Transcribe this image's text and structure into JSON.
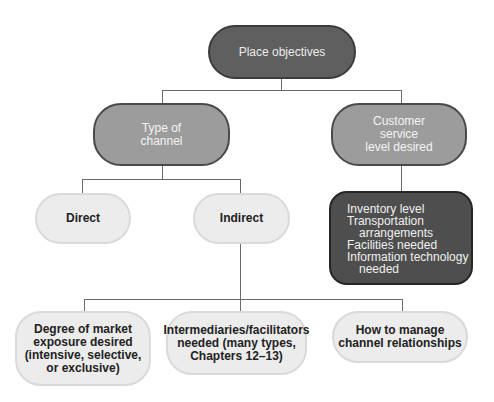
{
  "diagram": {
    "root": {
      "label": "Place objectives"
    },
    "level1": [
      {
        "label": "Type of\nchannel"
      },
      {
        "label": "Customer\nservice\nlevel desired"
      }
    ],
    "channel_types": [
      {
        "label": "Direct"
      },
      {
        "label": "Indirect"
      }
    ],
    "service_details": {
      "lines": [
        {
          "text": "Inventory level",
          "indent": false
        },
        {
          "text": "Transportation",
          "indent": false
        },
        {
          "text": "arrangements",
          "indent": true
        },
        {
          "text": "Facilities needed",
          "indent": false
        },
        {
          "text": "Information technology",
          "indent": false
        },
        {
          "text": "needed",
          "indent": true
        }
      ]
    },
    "indirect_decisions": [
      {
        "label": "Degree of market\nexposure desired\n(intensive, selective,\nor exclusive)"
      },
      {
        "label": "Intermediaries/facilitators\nneeded (many types,\nChapters 12–13)"
      },
      {
        "label": "How to manage\nchannel relationships"
      }
    ],
    "colors": {
      "root_fill": "#5f5f5f",
      "level1_fill": "#9c9c9c",
      "leaf_fill": "#ececec",
      "detail_fill": "#4e4e4e",
      "connector": "#6a6a6a"
    }
  }
}
